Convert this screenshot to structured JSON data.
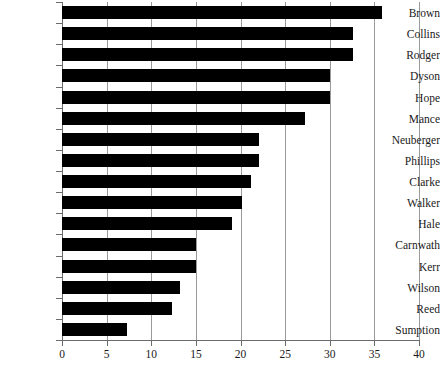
{
  "chart_data": {
    "type": "bar",
    "orientation": "horizontal",
    "title": "",
    "subtitle": "",
    "xlabel": "",
    "ylabel": "",
    "xlim": [
      0,
      40
    ],
    "xticks": [
      0,
      5,
      10,
      15,
      20,
      25,
      30,
      35,
      40
    ],
    "xticklabels": [
      "0",
      "5",
      "10",
      "15",
      "20",
      "25",
      "30",
      "35",
      "40"
    ],
    "grid": "vertical",
    "legend": "none",
    "bar_color": "#000000",
    "categories": [
      "Brown",
      "Collins",
      "Rodger",
      "Dyson",
      "Hope",
      "Mance",
      "Neuberger",
      "Phillips",
      "Clarke",
      "Walker",
      "Hale",
      "Carnwath",
      "Kerr",
      "Wilson",
      "Reed",
      "Sumption"
    ],
    "values": [
      35.8,
      32.6,
      32.6,
      30.0,
      30.0,
      27.2,
      22.1,
      22.1,
      21.2,
      20.2,
      19.0,
      15.0,
      15.0,
      13.2,
      12.3,
      7.3
    ]
  }
}
